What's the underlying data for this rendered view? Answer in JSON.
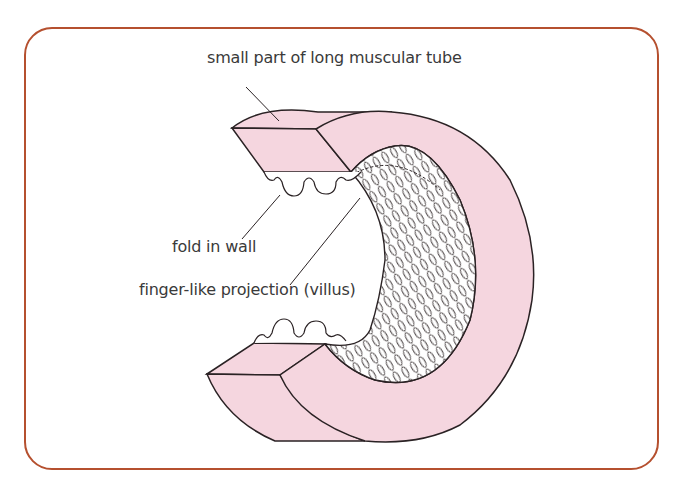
{
  "figure": {
    "frame_color": "#b5502f",
    "tissue_color": "#f5d6df",
    "outline_color": "#2a2224",
    "labels": {
      "tube": "small part of long muscular tube",
      "fold": "fold in wall",
      "villus": "finger-like projection (villus)"
    }
  }
}
